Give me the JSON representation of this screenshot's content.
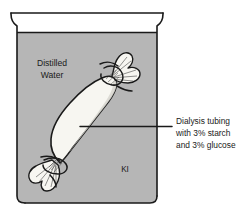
{
  "diagram": {
    "beaker": {
      "name": "beaker",
      "solution_label_line1": "Distilled",
      "solution_label_line2": "Water",
      "indicator_label": "KI"
    },
    "tubing": {
      "name": "dialysis-tubing",
      "callout_line1": "Dialysis tubing",
      "callout_line2": "with 3% starch",
      "callout_line3": "and 3% glucose"
    },
    "colors": {
      "solution_fill": "#b6b6b6",
      "beaker_air": "#ffffff",
      "tubing_fill": "#f7f6f1",
      "outline": "#1a1a1a",
      "text": "#1a1a1a",
      "page_background": "#ffffff"
    }
  }
}
